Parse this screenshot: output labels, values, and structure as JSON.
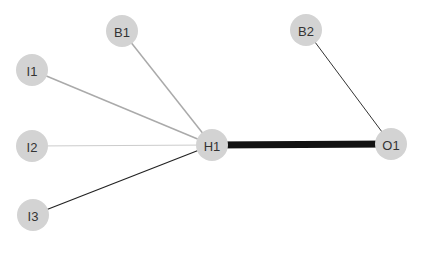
{
  "diagram": {
    "type": "neural-network",
    "node_radius": 16,
    "node_fill": "#d3d3d3",
    "label_color": "#333333",
    "nodes": [
      {
        "id": "B1",
        "label": "B1",
        "x": 122,
        "y": 31
      },
      {
        "id": "I1",
        "label": "I1",
        "x": 32,
        "y": 70
      },
      {
        "id": "I2",
        "label": "I2",
        "x": 32,
        "y": 146
      },
      {
        "id": "I3",
        "label": "I3",
        "x": 33,
        "y": 215
      },
      {
        "id": "H1",
        "label": "H1",
        "x": 212,
        "y": 145
      },
      {
        "id": "B2",
        "label": "B2",
        "x": 306,
        "y": 30
      },
      {
        "id": "O1",
        "label": "O1",
        "x": 391,
        "y": 144
      }
    ],
    "edges": [
      {
        "from": "B1",
        "to": "H1",
        "color": "#aaaaaa",
        "width": 1.5
      },
      {
        "from": "I1",
        "to": "H1",
        "color": "#aaaaaa",
        "width": 1.5
      },
      {
        "from": "I2",
        "to": "H1",
        "color": "#cccccc",
        "width": 1
      },
      {
        "from": "I3",
        "to": "H1",
        "color": "#222222",
        "width": 1.2
      },
      {
        "from": "H1",
        "to": "O1",
        "color": "#111111",
        "width": 7
      },
      {
        "from": "B2",
        "to": "O1",
        "color": "#333333",
        "width": 1
      }
    ]
  }
}
